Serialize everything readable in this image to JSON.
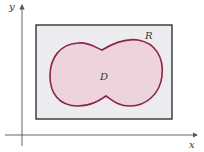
{
  "figure": {
    "axes": {
      "x_label": "x",
      "y_label": "y"
    },
    "rectangle": {
      "label": "R",
      "fill": "#ececf0",
      "stroke": "#333333"
    },
    "region": {
      "label": "D",
      "fill": "#ecd3dc",
      "stroke": "#8e2343"
    }
  }
}
